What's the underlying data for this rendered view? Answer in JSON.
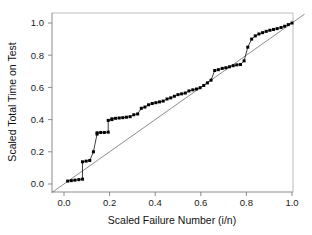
{
  "chart_data": {
    "type": "scatter",
    "title": "",
    "subtitle": "",
    "xlabel": "Scaled Failure Number (i/n)",
    "ylabel": "Scaled Total Time on Test",
    "xlim": [
      -0.06,
      1.06
    ],
    "ylim": [
      -0.06,
      1.06
    ],
    "xticks": [
      0.0,
      0.2,
      0.4,
      0.6,
      0.8,
      1.0
    ],
    "yticks": [
      0.0,
      0.2,
      0.4,
      0.6,
      0.8,
      1.0
    ],
    "xticklabels": [
      "0.0",
      "0.2",
      "0.4",
      "0.6",
      "0.8",
      "1.0"
    ],
    "yticklabels": [
      "0.0",
      "0.2",
      "0.4",
      "0.6",
      "0.8",
      "1.0"
    ],
    "grid": false,
    "legend": null,
    "marker": "filled-square",
    "marker_color": "#000000",
    "series": [
      {
        "name": "Scaled TTT",
        "type": "scatter",
        "connected": true,
        "x": [
          0.016,
          0.032,
          0.048,
          0.065,
          0.081,
          0.081,
          0.097,
          0.113,
          0.129,
          0.145,
          0.145,
          0.161,
          0.177,
          0.194,
          0.194,
          0.21,
          0.21,
          0.226,
          0.242,
          0.258,
          0.274,
          0.29,
          0.306,
          0.323,
          0.339,
          0.355,
          0.371,
          0.387,
          0.403,
          0.419,
          0.435,
          0.452,
          0.468,
          0.484,
          0.5,
          0.516,
          0.532,
          0.548,
          0.565,
          0.581,
          0.597,
          0.613,
          0.629,
          0.645,
          0.661,
          0.677,
          0.694,
          0.71,
          0.726,
          0.742,
          0.758,
          0.774,
          0.79,
          0.806,
          0.823,
          0.839,
          0.855,
          0.871,
          0.887,
          0.903,
          0.919,
          0.935,
          0.952,
          0.968,
          0.984,
          1.0
        ],
        "y": [
          0.018,
          0.021,
          0.024,
          0.027,
          0.03,
          0.138,
          0.142,
          0.146,
          0.2,
          0.31,
          0.318,
          0.32,
          0.32,
          0.322,
          0.395,
          0.4,
          0.405,
          0.408,
          0.41,
          0.412,
          0.415,
          0.418,
          0.43,
          0.435,
          0.47,
          0.478,
          0.492,
          0.5,
          0.505,
          0.51,
          0.515,
          0.528,
          0.535,
          0.545,
          0.555,
          0.56,
          0.565,
          0.578,
          0.585,
          0.59,
          0.598,
          0.612,
          0.628,
          0.645,
          0.705,
          0.71,
          0.718,
          0.722,
          0.728,
          0.735,
          0.74,
          0.742,
          0.765,
          0.85,
          0.9,
          0.92,
          0.932,
          0.94,
          0.948,
          0.955,
          0.96,
          0.965,
          0.972,
          0.98,
          0.99,
          1.0
        ]
      },
      {
        "name": "Reference diagonal",
        "type": "line",
        "connected": true,
        "x": [
          -0.055,
          1.055
        ],
        "y": [
          -0.055,
          1.055
        ]
      }
    ]
  },
  "axes": {
    "x_title": "Scaled Failure Number (i/n)",
    "y_title": "Scaled Total Time on Test"
  }
}
